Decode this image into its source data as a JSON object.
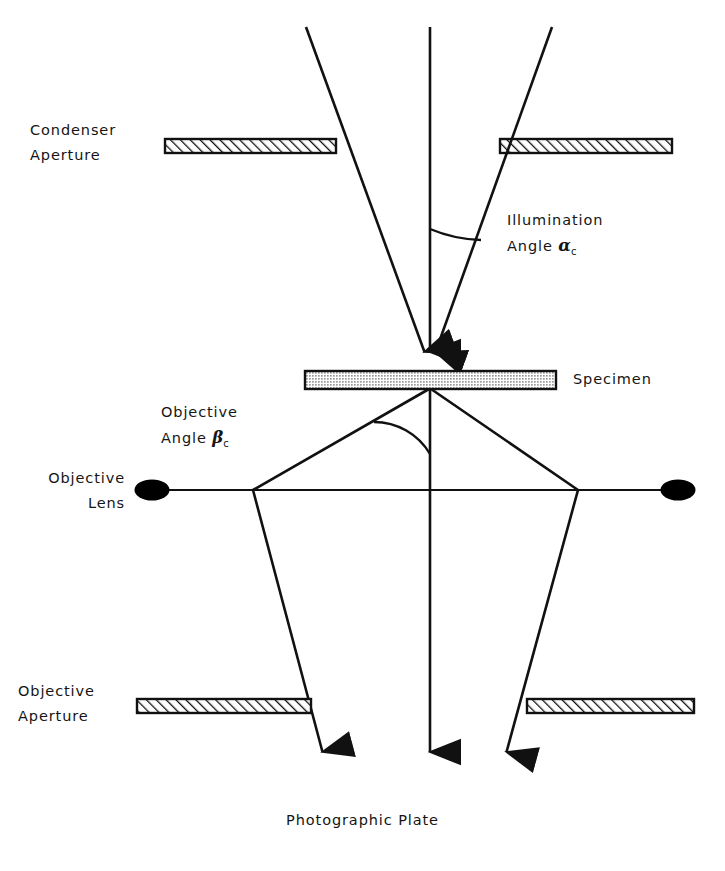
{
  "diagram": {
    "type": "optical-ray-diagram",
    "colors": {
      "stroke": "#111111",
      "fill_hatch": "#ffffff",
      "specimen_fill": "#b9b9b9",
      "lens_fill": "#000000",
      "background": "#ffffff"
    },
    "labels": {
      "condenser_aperture_line1": "Condenser",
      "condenser_aperture_line2": "Aperture",
      "illumination_angle_line1": "Illumination",
      "illumination_angle_line2_prefix": "Angle ",
      "illumination_angle_symbol": "α",
      "illumination_angle_subscript": "c",
      "specimen": "Specimen",
      "objective_angle_line1": "Objective",
      "objective_angle_line2_prefix": "Angle ",
      "objective_angle_symbol": "β",
      "objective_angle_subscript": "c",
      "objective_lens_line1": "Objective",
      "objective_lens_line2": "Lens",
      "objective_aperture_line1": "Objective",
      "objective_aperture_line2": "Aperture",
      "photographic_plate": "Photographic Plate"
    },
    "elements": {
      "condenser_aperture": {
        "name": "condenser-aperture",
        "y_top": 139,
        "y_bottom": 153,
        "left_bar": {
          "x1": 165,
          "x2": 336
        },
        "right_bar": {
          "x1": 500,
          "x2": 672
        },
        "hatch": "diagonal-forward"
      },
      "specimen": {
        "name": "specimen",
        "x1": 305,
        "x2": 556,
        "y_top": 371,
        "y_bottom": 389,
        "fill": "stipple-gray"
      },
      "objective_lens": {
        "name": "objective-lens",
        "y": 490,
        "line_x1": 137,
        "line_x2": 693,
        "left_ellipse_cx": 152,
        "right_ellipse_cx": 678,
        "ellipse_rx": 17,
        "ellipse_ry": 10
      },
      "objective_aperture": {
        "name": "objective-aperture",
        "y_top": 699,
        "y_bottom": 713,
        "left_bar": {
          "x1": 137,
          "x2": 311
        },
        "right_bar": {
          "x1": 527,
          "x2": 694
        },
        "hatch": "diagonal-forward"
      },
      "optical_axis": {
        "x": 430,
        "y1": 27,
        "y2": 782
      },
      "incident_rays": [
        {
          "name": "left-incident-ray",
          "x1": 306,
          "y1": 27,
          "x2": 427,
          "y2": 372
        },
        {
          "name": "center-incident-ray",
          "x1": 430,
          "y1": 27,
          "x2": 430,
          "y2": 372
        },
        {
          "name": "right-incident-ray",
          "x1": 552,
          "y1": 27,
          "x2": 433,
          "y2": 372
        }
      ],
      "diffracted_rays": [
        {
          "name": "left-diffracted-ray",
          "x1": 429,
          "y1": 389,
          "x2": 253,
          "y2": 490,
          "x3": 326,
          "y3": 782
        },
        {
          "name": "center-diffracted-ray",
          "x1": 430,
          "y1": 389,
          "x2": 430,
          "y2": 782
        },
        {
          "name": "right-diffracted-ray",
          "x1": 431,
          "y1": 389,
          "x2": 578,
          "y2": 490,
          "x3": 503,
          "y3": 782
        }
      ],
      "angle_arcs": [
        {
          "name": "illumination-angle-arc",
          "apex_x": 430,
          "apex_y": 372,
          "radius": 142
        },
        {
          "name": "objective-angle-arc",
          "apex_x": 430,
          "apex_y": 389,
          "radius": 65
        }
      ]
    }
  }
}
